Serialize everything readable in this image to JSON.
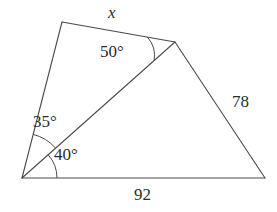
{
  "figure": {
    "kind": "geometry-diagram",
    "background_color": "#ffffff",
    "stroke_color": "#4a4a4a",
    "text_color": "#2b2b2b",
    "canvas": {
      "width": 277,
      "height": 212
    },
    "vertices": [
      {
        "name": "bottom-left",
        "id": "A",
        "x": 22,
        "y": 178
      },
      {
        "name": "top-left",
        "id": "B",
        "x": 62,
        "y": 22
      },
      {
        "name": "top-right",
        "id": "C",
        "x": 175,
        "y": 42
      },
      {
        "name": "bottom-right",
        "id": "D",
        "x": 265,
        "y": 178
      }
    ],
    "edges": [
      {
        "name": "left-side",
        "from": "A",
        "to": "B"
      },
      {
        "name": "top-side",
        "from": "B",
        "to": "C",
        "label": "x"
      },
      {
        "name": "right-side",
        "from": "C",
        "to": "D",
        "label": "78"
      },
      {
        "name": "bottom-side",
        "from": "A",
        "to": "D",
        "label": "92"
      },
      {
        "name": "diagonal",
        "from": "A",
        "to": "C"
      }
    ],
    "labels": {
      "unknown_side": "x",
      "right_side": "78",
      "bottom_side": "92",
      "angle_upper_vertex": "50°",
      "angle_left_upper": "35°",
      "angle_left_lower": "40°"
    },
    "angle_arcs": [
      {
        "name": "arc-50-at-top-right",
        "vertex": "C",
        "radius": 28,
        "measure": "50°"
      },
      {
        "name": "arc-35-at-bottom-left-upper",
        "vertex": "A",
        "radius": 45,
        "measure": "35°"
      },
      {
        "name": "arc-40-at-bottom-left-lower",
        "vertex": "A",
        "radius": 35,
        "measure": "40°"
      }
    ]
  }
}
